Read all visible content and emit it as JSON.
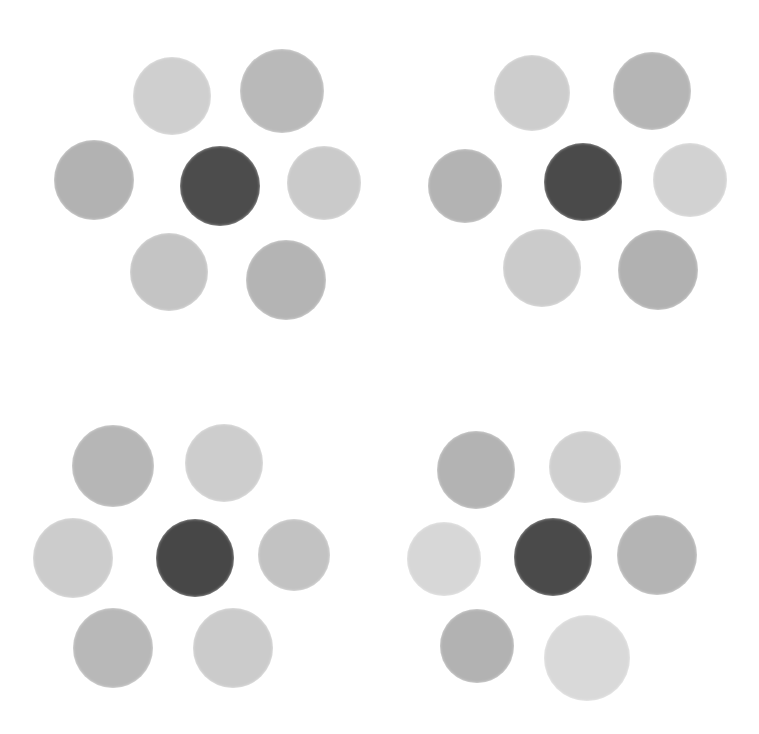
{
  "image": {
    "description": "Four clusters of hand-painted gray discs, each with a dark central disc surrounded by six lighter gray discs",
    "background": "#ffffff"
  },
  "groups": [
    {
      "name": "top-left",
      "discs": [
        {
          "role": "center",
          "cx": 220,
          "cy": 186,
          "r": 40,
          "color": "#4c4c4c"
        },
        {
          "role": "surround",
          "cx": 172,
          "cy": 96,
          "r": 39,
          "color": "#cfcfcf"
        },
        {
          "role": "surround",
          "cx": 282,
          "cy": 91,
          "r": 42,
          "color": "#b9b9b9"
        },
        {
          "role": "surround",
          "cx": 94,
          "cy": 180,
          "r": 40,
          "color": "#b2b2b2"
        },
        {
          "role": "surround",
          "cx": 324,
          "cy": 183,
          "r": 37,
          "color": "#cacaca"
        },
        {
          "role": "surround",
          "cx": 169,
          "cy": 272,
          "r": 39,
          "color": "#c4c4c4"
        },
        {
          "role": "surround",
          "cx": 286,
          "cy": 280,
          "r": 40,
          "color": "#b4b4b4"
        }
      ]
    },
    {
      "name": "top-right",
      "discs": [
        {
          "role": "center",
          "cx": 583,
          "cy": 182,
          "r": 39,
          "color": "#4a4a4a"
        },
        {
          "role": "surround",
          "cx": 532,
          "cy": 93,
          "r": 38,
          "color": "#cdcdcd"
        },
        {
          "role": "surround",
          "cx": 652,
          "cy": 91,
          "r": 39,
          "color": "#b5b5b5"
        },
        {
          "role": "surround",
          "cx": 465,
          "cy": 186,
          "r": 37,
          "color": "#b3b3b3"
        },
        {
          "role": "surround",
          "cx": 690,
          "cy": 180,
          "r": 37,
          "color": "#d2d2d2"
        },
        {
          "role": "surround",
          "cx": 542,
          "cy": 268,
          "r": 39,
          "color": "#cbcbcb"
        },
        {
          "role": "surround",
          "cx": 658,
          "cy": 270,
          "r": 40,
          "color": "#b1b1b1"
        }
      ]
    },
    {
      "name": "bottom-left",
      "discs": [
        {
          "role": "center",
          "cx": 195,
          "cy": 558,
          "r": 39,
          "color": "#474747"
        },
        {
          "role": "surround",
          "cx": 113,
          "cy": 466,
          "r": 41,
          "color": "#b6b6b6"
        },
        {
          "role": "surround",
          "cx": 224,
          "cy": 463,
          "r": 39,
          "color": "#cdcdcd"
        },
        {
          "role": "surround",
          "cx": 73,
          "cy": 558,
          "r": 40,
          "color": "#cccccc"
        },
        {
          "role": "surround",
          "cx": 294,
          "cy": 555,
          "r": 36,
          "color": "#c2c2c2"
        },
        {
          "role": "surround",
          "cx": 113,
          "cy": 648,
          "r": 40,
          "color": "#b8b8b8"
        },
        {
          "role": "surround",
          "cx": 233,
          "cy": 648,
          "r": 40,
          "color": "#cbcbcb"
        }
      ]
    },
    {
      "name": "bottom-right",
      "discs": [
        {
          "role": "center",
          "cx": 553,
          "cy": 557,
          "r": 39,
          "color": "#4a4a4a"
        },
        {
          "role": "surround",
          "cx": 476,
          "cy": 470,
          "r": 39,
          "color": "#b3b3b3"
        },
        {
          "role": "surround",
          "cx": 585,
          "cy": 467,
          "r": 36,
          "color": "#cfcfcf"
        },
        {
          "role": "surround",
          "cx": 444,
          "cy": 559,
          "r": 37,
          "color": "#d7d7d7"
        },
        {
          "role": "surround",
          "cx": 657,
          "cy": 555,
          "r": 40,
          "color": "#b4b4b4"
        },
        {
          "role": "surround",
          "cx": 477,
          "cy": 646,
          "r": 37,
          "color": "#b2b2b2"
        },
        {
          "role": "surround",
          "cx": 587,
          "cy": 658,
          "r": 43,
          "color": "#d9d9d9"
        }
      ]
    }
  ]
}
